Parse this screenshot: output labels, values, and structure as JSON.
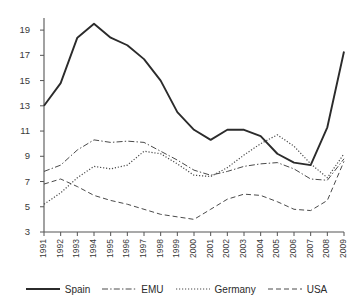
{
  "chart_data": {
    "type": "line",
    "title": "",
    "subtitle": "",
    "xlabel": "",
    "ylabel": "",
    "x": [
      1991,
      1992,
      1993,
      1994,
      1995,
      1996,
      1997,
      1998,
      1999,
      2000,
      2001,
      2002,
      2003,
      2004,
      2005,
      2006,
      2007,
      2008,
      2009
    ],
    "categories": [
      "1991",
      "1992",
      "1993",
      "1994",
      "1995",
      "1996",
      "1997",
      "1998",
      "1999",
      "2000",
      "2001",
      "2002",
      "2003",
      "2004",
      "2005",
      "2006",
      "2007",
      "2008",
      "2009"
    ],
    "xlim": [
      1991,
      2009
    ],
    "ylim": [
      3,
      19.8
    ],
    "yticks": [
      3,
      5,
      7,
      9,
      11,
      13,
      15,
      17,
      19
    ],
    "ytick_labels": [
      "3",
      "5",
      "7",
      "9",
      "11",
      "13",
      "15",
      "17",
      "19"
    ],
    "grid": false,
    "legend_position": "bottom",
    "series": [
      {
        "name": "Spain",
        "style": "solid",
        "color": "#2b2b2b",
        "width": 1.9,
        "values": [
          13.0,
          14.8,
          18.4,
          19.5,
          18.4,
          17.8,
          16.7,
          15.0,
          12.5,
          11.1,
          10.3,
          11.1,
          11.1,
          10.6,
          9.2,
          8.5,
          8.3,
          11.3,
          17.3
        ]
      },
      {
        "name": "EMU",
        "style": "dashdot",
        "color": "#4a4a4a",
        "width": 1.0,
        "values": [
          7.8,
          8.3,
          9.5,
          10.3,
          10.1,
          10.2,
          10.1,
          9.4,
          8.7,
          7.9,
          7.5,
          7.8,
          8.2,
          8.4,
          8.5,
          8.0,
          7.2,
          7.1,
          8.8
        ]
      },
      {
        "name": "Germany",
        "style": "dotted",
        "color": "#4a4a4a",
        "width": 1.2,
        "values": [
          5.2,
          6.1,
          7.3,
          8.2,
          8.0,
          8.3,
          9.4,
          9.2,
          8.4,
          7.5,
          7.4,
          8.1,
          9.1,
          10.0,
          10.7,
          9.8,
          8.4,
          7.3,
          9.2
        ]
      },
      {
        "name": "USA",
        "style": "dashed",
        "color": "#4a4a4a",
        "width": 1.0,
        "values": [
          6.8,
          7.2,
          6.6,
          5.9,
          5.5,
          5.2,
          4.8,
          4.4,
          4.2,
          4.0,
          4.8,
          5.6,
          6.0,
          5.9,
          5.4,
          4.8,
          4.7,
          5.5,
          8.6
        ]
      }
    ]
  },
  "legend": {
    "items": [
      {
        "label": "Spain",
        "style": "solid"
      },
      {
        "label": "EMU",
        "style": "dashdot"
      },
      {
        "label": "Germany",
        "style": "dotted"
      },
      {
        "label": "USA",
        "style": "dashed"
      }
    ]
  },
  "axes": {
    "axis_color": "#555555"
  }
}
